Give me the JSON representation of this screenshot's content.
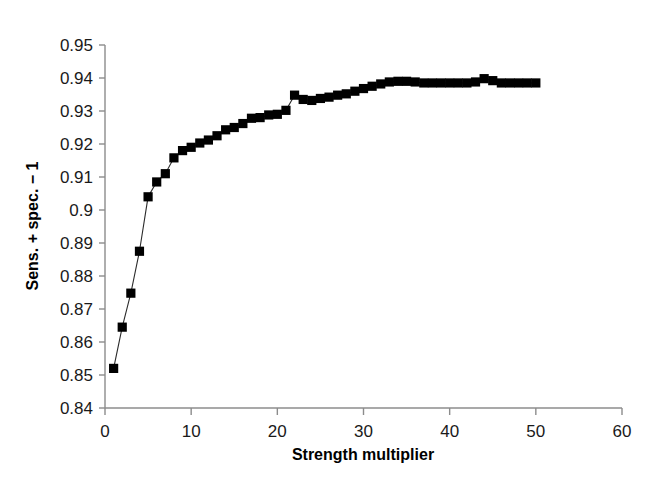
{
  "chart_data": {
    "type": "line",
    "title": "",
    "xlabel": "Strength multiplier",
    "ylabel": "Sens. + spec. − 1",
    "xlim": [
      0,
      60
    ],
    "ylim": [
      0.84,
      0.95
    ],
    "xticks": [
      0,
      10,
      20,
      30,
      40,
      50,
      60
    ],
    "yticks": [
      0.84,
      0.85,
      0.86,
      0.87,
      0.88,
      0.89,
      0.9,
      0.91,
      0.92,
      0.93,
      0.94,
      0.95
    ],
    "xtick_labels": [
      "0",
      "10",
      "20",
      "30",
      "40",
      "50",
      "60"
    ],
    "ytick_labels": [
      "0.84",
      "0.85",
      "0.86",
      "0.87",
      "0.88",
      "0.89",
      "0.9",
      "0.91",
      "0.92",
      "0.93",
      "0.94",
      "0.95"
    ],
    "grid": false,
    "legend": null,
    "marker": "square",
    "marker_color": "#000000",
    "line_color": "#2b2b2b",
    "series": [
      {
        "name": "Sens. + spec. - 1 vs strength multiplier",
        "x": [
          1,
          2,
          3,
          4,
          5,
          6,
          7,
          8,
          9,
          10,
          11,
          12,
          13,
          14,
          15,
          16,
          17,
          18,
          19,
          20,
          21,
          22,
          23,
          24,
          25,
          26,
          27,
          28,
          29,
          30,
          31,
          32,
          33,
          34,
          35,
          36,
          37,
          38,
          39,
          40,
          41,
          42,
          43,
          44,
          45,
          46,
          47,
          48,
          49,
          50
        ],
        "values": [
          0.852,
          0.8645,
          0.8748,
          0.8875,
          0.904,
          0.9085,
          0.911,
          0.9158,
          0.918,
          0.919,
          0.9203,
          0.9212,
          0.9225,
          0.9243,
          0.925,
          0.9262,
          0.9278,
          0.928,
          0.9288,
          0.929,
          0.9302,
          0.9348,
          0.9335,
          0.9332,
          0.9338,
          0.9342,
          0.9348,
          0.9352,
          0.936,
          0.9368,
          0.9375,
          0.9382,
          0.9388,
          0.939,
          0.939,
          0.9388,
          0.9385,
          0.9385,
          0.9385,
          0.9385,
          0.9385,
          0.9385,
          0.9388,
          0.9398,
          0.9392,
          0.9385,
          0.9385,
          0.9385,
          0.9385,
          0.9385
        ]
      }
    ]
  },
  "axes": {
    "x_axis_label": "Strength multiplier",
    "y_axis_label": "Sens. + spec. − 1"
  }
}
